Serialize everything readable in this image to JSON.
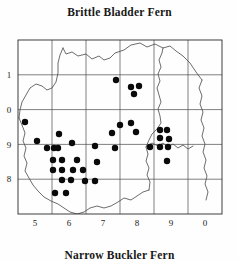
{
  "map": {
    "title": "Brittle Bladder Fern",
    "caption": "Narrow Buckler Fern",
    "type": "distribution-dot-map",
    "frame": {
      "x": 18,
      "y": 10,
      "width": 204,
      "height": 174
    },
    "grid": {
      "columns": 6,
      "rows": 5,
      "cell_width": 34,
      "cell_height": 34.8,
      "visible": true
    },
    "axis": {
      "x_labels": [
        "5",
        "6",
        "7",
        "8",
        "9",
        "0"
      ],
      "y_labels": [
        "1",
        "0",
        "9",
        "8"
      ],
      "x_label_y": 196,
      "y_label_x": 9
    },
    "dot_radius": 3.2,
    "dots": [
      {
        "x": 116,
        "y": 50
      },
      {
        "x": 131,
        "y": 57
      },
      {
        "x": 139,
        "y": 56
      },
      {
        "x": 134,
        "y": 64
      },
      {
        "x": 25,
        "y": 92
      },
      {
        "x": 120,
        "y": 95
      },
      {
        "x": 131,
        "y": 93
      },
      {
        "x": 112,
        "y": 103
      },
      {
        "x": 136,
        "y": 102
      },
      {
        "x": 59,
        "y": 104
      },
      {
        "x": 160,
        "y": 100
      },
      {
        "x": 167,
        "y": 100
      },
      {
        "x": 160,
        "y": 108
      },
      {
        "x": 169,
        "y": 109
      },
      {
        "x": 37,
        "y": 111
      },
      {
        "x": 47,
        "y": 118
      },
      {
        "x": 54,
        "y": 118
      },
      {
        "x": 58,
        "y": 118
      },
      {
        "x": 72,
        "y": 113
      },
      {
        "x": 95,
        "y": 116
      },
      {
        "x": 115,
        "y": 118
      },
      {
        "x": 150,
        "y": 117
      },
      {
        "x": 160,
        "y": 117
      },
      {
        "x": 168,
        "y": 117
      },
      {
        "x": 53,
        "y": 130
      },
      {
        "x": 62,
        "y": 130
      },
      {
        "x": 77,
        "y": 130
      },
      {
        "x": 97,
        "y": 132
      },
      {
        "x": 167,
        "y": 131
      },
      {
        "x": 53,
        "y": 140
      },
      {
        "x": 62,
        "y": 140
      },
      {
        "x": 73,
        "y": 140
      },
      {
        "x": 83,
        "y": 140
      },
      {
        "x": 62,
        "y": 150
      },
      {
        "x": 71,
        "y": 150
      },
      {
        "x": 85,
        "y": 151
      },
      {
        "x": 95,
        "y": 151
      },
      {
        "x": 55,
        "y": 163
      },
      {
        "x": 66,
        "y": 163
      }
    ],
    "coast_paths": [
      "M 63 18 L 66 24 L 72 22 L 78 26 L 86 24 L 92 29 L 99 26 L 104 30 L 110 28 L 115 23 L 124 20 L 131 15 L 140 13 L 147 17 L 155 14 L 163 18 L 170 16 L 176 21 L 183 26 L 190 33 L 196 42 L 202 50",
      "M 63 18 L 60 25 L 58 33 L 58 43 L 56 52 L 52 58 L 47 60 L 42 56 L 36 54 L 30 58 L 26 65 L 22 72 L 20 80 L 19 88",
      "M 19 88 L 22 95 L 25 103 L 23 111 L 26 118 L 24 126 L 27 133 L 25 141 L 29 148 L 33 155 L 38 161 L 44 167 L 51 171 L 58 174 L 64 178 L 70 182 L 77 184 L 84 182 L 90 178 L 97 176 L 104 178 L 111 176 L 118 172 L 124 168 L 131 170 L 137 166 L 143 162 L 149 160",
      "M 149 160 L 150 152 L 147 145 L 149 138 L 146 131 L 148 124 L 146 117 L 149 110 L 152 104 L 157 99 L 161 93 L 160 86 L 158 79 L 161 72 L 159 65 L 157 58 L 160 51 L 158 44 L 161 37 L 159 30 L 162 23 L 163 18",
      "M 202 50 L 199 58 L 202 66 L 200 74 L 203 82 L 201 90 L 204 98 L 202 106 L 205 114 L 203 122 L 206 130 L 204 138 L 207 146 L 205 154 L 208 162 L 206 170",
      "M 146 117 L 152 113 L 158 116 L 163 113 L 168 117 L 173 114 L 178 118 L 183 115 L 188 119 L 193 116"
    ]
  }
}
